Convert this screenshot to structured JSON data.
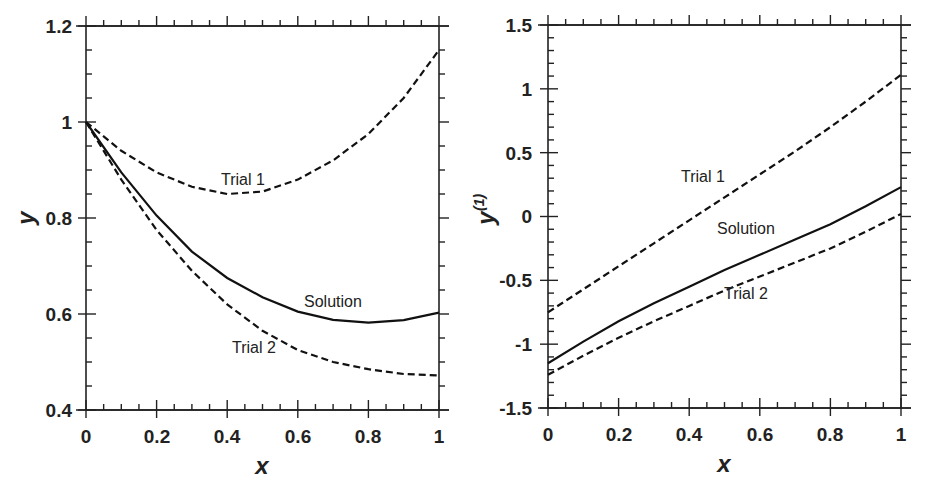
{
  "chart_data": [
    {
      "type": "line",
      "title": "",
      "xlabel": "x",
      "ylabel": "y",
      "xlim": [
        0,
        1
      ],
      "ylim": [
        0.4,
        1.2
      ],
      "xticks": [
        "0",
        "0.2",
        "0.4",
        "0.6",
        "0.8",
        "1"
      ],
      "yticks": [
        "0.4",
        "0.6",
        "0.8",
        "1",
        "1.2"
      ],
      "grid": false,
      "legend": "inline annotations",
      "x": [
        0,
        0.1,
        0.2,
        0.3,
        0.4,
        0.5,
        0.6,
        0.7,
        0.8,
        0.9,
        1.0
      ],
      "series": [
        {
          "name": "Trial 1",
          "style": "dashed",
          "values": [
            1.0,
            0.94,
            0.895,
            0.865,
            0.85,
            0.855,
            0.88,
            0.92,
            0.975,
            1.05,
            1.15
          ]
        },
        {
          "name": "Solution",
          "style": "solid",
          "values": [
            1.0,
            0.895,
            0.805,
            0.73,
            0.675,
            0.635,
            0.605,
            0.588,
            0.582,
            0.587,
            0.603
          ]
        },
        {
          "name": "Trial 2",
          "style": "dashed",
          "values": [
            1.0,
            0.88,
            0.775,
            0.69,
            0.62,
            0.565,
            0.525,
            0.5,
            0.485,
            0.475,
            0.472
          ]
        }
      ],
      "annotations": [
        "Trial 1",
        "Solution",
        "Trial 2"
      ]
    },
    {
      "type": "line",
      "title": "",
      "xlabel": "x",
      "ylabel": "y(1)",
      "xlim": [
        0,
        1
      ],
      "ylim": [
        -1.5,
        1.5
      ],
      "xticks": [
        "0",
        "0.2",
        "0.4",
        "0.6",
        "0.8",
        "1"
      ],
      "yticks": [
        "-1.5",
        "-1",
        "-0.5",
        "0",
        "0.5",
        "1",
        "1.5"
      ],
      "grid": false,
      "legend": "inline annotations",
      "x": [
        0,
        0.1,
        0.2,
        0.3,
        0.4,
        0.5,
        0.6,
        0.7,
        0.8,
        0.9,
        1.0
      ],
      "series": [
        {
          "name": "Trial 1",
          "style": "dashed",
          "values": [
            -0.75,
            -0.57,
            -0.39,
            -0.21,
            -0.03,
            0.15,
            0.33,
            0.51,
            0.7,
            0.9,
            1.11
          ]
        },
        {
          "name": "Solution",
          "style": "solid",
          "values": [
            -1.15,
            -0.98,
            -0.82,
            -0.68,
            -0.55,
            -0.42,
            -0.3,
            -0.18,
            -0.06,
            0.08,
            0.23
          ]
        },
        {
          "name": "Trial 2",
          "style": "dashed",
          "values": [
            -1.24,
            -1.09,
            -0.95,
            -0.82,
            -0.7,
            -0.58,
            -0.47,
            -0.36,
            -0.25,
            -0.12,
            0.02
          ]
        }
      ],
      "annotations": [
        "Trial 1",
        "Solution",
        "Trial 2"
      ]
    }
  ],
  "left": {
    "xlabel": "x",
    "ylabel": "y",
    "xticks": [
      "0",
      "0.2",
      "0.4",
      "0.6",
      "0.8",
      "1"
    ],
    "yticks": [
      "0.4",
      "0.6",
      "0.8",
      "1",
      "1.2"
    ],
    "labels": {
      "trial1": "Trial 1",
      "solution": "Solution",
      "trial2": "Trial 2"
    }
  },
  "right": {
    "xlabel": "x",
    "ylabel_base": "y",
    "ylabel_sup": "(1)",
    "xticks": [
      "0",
      "0.2",
      "0.4",
      "0.6",
      "0.8",
      "1"
    ],
    "yticks": [
      "-1.5",
      "-1",
      "-0.5",
      "0",
      "0.5",
      "1",
      "1.5"
    ],
    "labels": {
      "trial1": "Trial 1",
      "solution": "Solution",
      "trial2": "Trial 2"
    }
  }
}
